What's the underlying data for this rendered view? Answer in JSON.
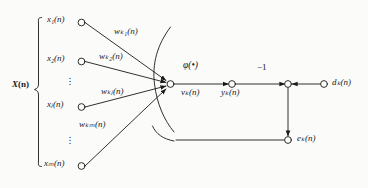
{
  "diagram": {
    "type": "neural-network-signal-flow-graph",
    "stroke_color": "#1a1a1a",
    "background_color": "#fbfbfa"
  },
  "input_vector": {
    "label_main": "X",
    "label_arg": "(n)",
    "brace": "left-curly-brace"
  },
  "inputs": [
    {
      "id": "x1",
      "base": "x",
      "sub": "1",
      "arg": "(n)",
      "text": "x₁(n)",
      "node_x": 80,
      "node_y": 22
    },
    {
      "id": "x2",
      "base": "x",
      "sub": "2",
      "arg": "(n)",
      "text": "x₂(n)",
      "node_x": 80,
      "node_y": 61
    },
    {
      "id": "xj",
      "base": "x",
      "sub": "j",
      "arg": "(n)",
      "text": "xⱼ(n)",
      "node_x": 80,
      "node_y": 107
    },
    {
      "id": "xm",
      "base": "x",
      "sub": "m",
      "arg": "(n)",
      "text": "xₘ(n)",
      "node_x": 80,
      "node_y": 166
    }
  ],
  "vertical_ellipses": [
    {
      "id": "ellipsis-upper",
      "x": 69,
      "y": 78
    },
    {
      "id": "ellipsis-lower",
      "x": 69,
      "y": 137
    }
  ],
  "weights": [
    {
      "id": "wk1",
      "base": "w",
      "sub": "k1",
      "arg": "(n)",
      "text": "wₖ₁(n)",
      "x": 92,
      "y": 32
    },
    {
      "id": "wk2",
      "base": "w",
      "sub": "k2",
      "arg": "(n)",
      "text": "wₖ₂(n)",
      "x": 96,
      "y": 53
    },
    {
      "id": "wkj",
      "base": "w",
      "sub": "kj",
      "arg": "(n)",
      "text": "wₖⱼ(n)",
      "x": 98,
      "y": 88
    },
    {
      "id": "wkm",
      "base": "w",
      "sub": "km",
      "arg": "(n)",
      "text": "wₖₘ(n)",
      "x": 76,
      "y": 121
    }
  ],
  "activation": {
    "id": "phi",
    "text": "φ(•)",
    "x": 186,
    "y": 66
  },
  "signals": {
    "induced_field": {
      "id": "vk",
      "base": "v",
      "sub": "k",
      "arg": "(n)",
      "text": "vₖ(n)",
      "x": 184,
      "y": 88
    },
    "output": {
      "id": "yk",
      "base": "y",
      "sub": "k",
      "arg": "(n)",
      "text": "yₖ(n)",
      "x": 223,
      "y": 88
    },
    "desired": {
      "id": "dk",
      "base": "d",
      "sub": "k",
      "arg": "(n)",
      "text": "dₖ(n)",
      "x": 332,
      "y": 77
    },
    "error": {
      "id": "ek",
      "base": "e",
      "sub": "k",
      "arg": "(n)",
      "text": "eₖ(n)",
      "x": 300,
      "y": 116
    },
    "bias_gain": {
      "id": "minus-one",
      "text": "−1",
      "x": 258,
      "y": 62
    }
  },
  "nodes": [
    {
      "id": "summing-junction",
      "x": 170,
      "y": 84,
      "filled": false
    },
    {
      "id": "output-node",
      "x": 232,
      "y": 84,
      "filled": false
    },
    {
      "id": "comparator-node",
      "x": 288,
      "y": 84,
      "filled": false
    },
    {
      "id": "desired-input-node",
      "x": 324,
      "y": 84,
      "filled": false
    },
    {
      "id": "error-node",
      "x": 288,
      "y": 140,
      "filled": false
    }
  ]
}
